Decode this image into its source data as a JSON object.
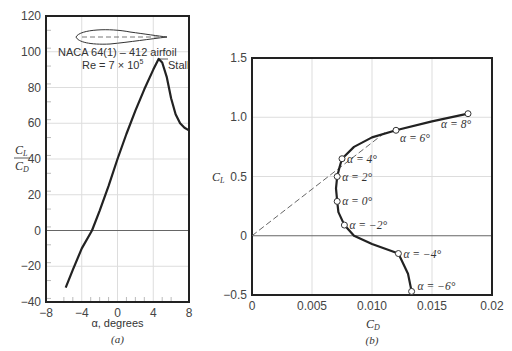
{
  "chart_data": [
    {
      "panel": "(a)",
      "type": "line",
      "title": "NACA 64(1) – 412 airfoil",
      "subtitle": "Re = 7 × 10^5",
      "xlabel": "α, degrees",
      "ylabel": "CL/CD",
      "xlim": [
        -8,
        8
      ],
      "ylim": [
        -40,
        120
      ],
      "xticks": [
        "-8",
        "-4",
        "0",
        "4",
        "8"
      ],
      "yticks": [
        "-40",
        "-20",
        "0",
        "20",
        "40",
        "60",
        "80",
        "100",
        "120"
      ],
      "grid": true,
      "annotations": [
        "Stall"
      ],
      "series": [
        {
          "name": "CL/CD",
          "x": [
            -5.8,
            -5,
            -4,
            -3,
            -2.85,
            -2,
            -1,
            0,
            1,
            2,
            3,
            4,
            4.6,
            5,
            5.5,
            6,
            6.5,
            7,
            8
          ],
          "y": [
            -32,
            -22,
            -10,
            3,
            0,
            13,
            27,
            41,
            55,
            68,
            80,
            90,
            97,
            96,
            88,
            76,
            66,
            60,
            56
          ]
        }
      ]
    },
    {
      "panel": "(b)",
      "type": "line",
      "xlabel": "CD",
      "ylabel": "CL",
      "xlim": [
        0,
        0.02
      ],
      "ylim": [
        -0.5,
        1.5
      ],
      "xticks": [
        "0",
        "0.005",
        "0.010",
        "0.015",
        "0.02"
      ],
      "yticks": [
        "-0.5",
        "0",
        "0.5",
        "1.0",
        "1.5"
      ],
      "grid": true,
      "series": [
        {
          "name": "drag polar",
          "points": [
            {
              "alpha": "α = −6°",
              "cd": 0.0133,
              "cl": -0.47
            },
            {
              "alpha": "α = −4°",
              "cd": 0.0122,
              "cl": -0.15
            },
            {
              "alpha": "α = −2°",
              "cd": 0.0077,
              "cl": 0.09
            },
            {
              "alpha": "α = 0°",
              "cd": 0.0071,
              "cl": 0.29
            },
            {
              "alpha": "α = 2°",
              "cd": 0.0071,
              "cl": 0.5
            },
            {
              "alpha": "α = 4°",
              "cd": 0.0075,
              "cl": 0.65
            },
            {
              "alpha": "α = 6°",
              "cd": 0.012,
              "cl": 0.89
            },
            {
              "alpha": "α = 8°",
              "cd": 0.018,
              "cl": 1.03
            }
          ]
        },
        {
          "name": "tangent line (max CL/CD)",
          "style": "dashed",
          "x": [
            0,
            0.0112
          ],
          "y": [
            0,
            0.88
          ]
        }
      ]
    }
  ],
  "labels": {
    "a_title": "NACA 64(1) – 412 airfoil",
    "a_re": "Re = 7 × 10",
    "a_re_exp": "5",
    "a_stall": "Stall",
    "a_xlabel": "α, degrees",
    "a_panel": "(a)",
    "a_ylabel_num": "C",
    "a_ylabel_num_sub": "L",
    "a_ylabel_den": "C",
    "a_ylabel_den_sub": "D",
    "b_xlabel": "C",
    "b_xlabel_sub": "D",
    "b_ylabel": "C",
    "b_ylabel_sub": "L",
    "b_panel": "(b)"
  }
}
